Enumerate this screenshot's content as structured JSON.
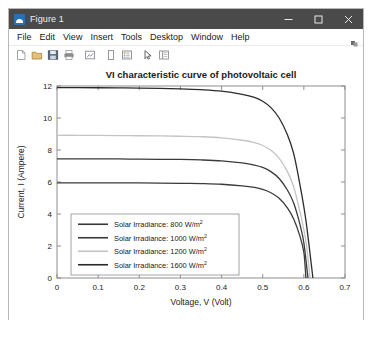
{
  "window": {
    "title": "Figure 1",
    "icon": "matlab-figure-icon",
    "controls": [
      {
        "name": "minimize",
        "glyph": "minimize-icon"
      },
      {
        "name": "maximize",
        "glyph": "maximize-icon"
      },
      {
        "name": "close",
        "glyph": "close-icon"
      }
    ]
  },
  "menubar": {
    "items": [
      "File",
      "Edit",
      "View",
      "Insert",
      "Tools",
      "Desktop",
      "Window",
      "Help"
    ],
    "overflow_icon": "overflow-chevron-icon"
  },
  "toolbar": {
    "buttons": [
      "new-figure-icon",
      "open-file-icon",
      "save-figure-icon",
      "print-figure-icon",
      "link-plot-icon",
      "insert-colorbar-icon",
      "insert-legend-icon",
      "edit-plot-icon",
      "hide-plot-tools-icon"
    ]
  },
  "chart_data": {
    "type": "line",
    "title": "VI characteristic curve of photovoltaic cell",
    "xlabel": "Voltage, V (Volt)",
    "ylabel": "Current, I (Ampere)",
    "xlim": [
      0,
      0.7
    ],
    "ylim": [
      0,
      12
    ],
    "xticks": [
      0,
      0.1,
      0.2,
      0.3,
      0.4,
      0.5,
      0.6,
      0.7
    ],
    "xtick_labels": [
      "0",
      "0.1",
      "0.2",
      "0.3",
      "0.4",
      "0.5",
      "0.6",
      "0.7"
    ],
    "yticks": [
      0,
      2,
      4,
      6,
      8,
      10,
      12
    ],
    "ytick_labels": [
      "0",
      "2",
      "4",
      "6",
      "8",
      "10",
      "12"
    ],
    "grid": false,
    "legend_position": "lower-left",
    "series": [
      {
        "name": "Solar Irradiance: 800 W/m",
        "superscript": "2",
        "irradiance": 800,
        "color": "#3a3a3a",
        "isc": 5.95,
        "voc": 0.605,
        "x": [
          0,
          0.05,
          0.1,
          0.15,
          0.2,
          0.25,
          0.3,
          0.35,
          0.4,
          0.45,
          0.48,
          0.5,
          0.52,
          0.54,
          0.56,
          0.575,
          0.59,
          0.6,
          0.605
        ],
        "y": [
          5.95,
          5.95,
          5.95,
          5.94,
          5.94,
          5.93,
          5.92,
          5.9,
          5.86,
          5.76,
          5.66,
          5.54,
          5.33,
          4.98,
          4.38,
          3.7,
          2.65,
          1.6,
          0.0
        ]
      },
      {
        "name": "Solar Irradiance: 1000 W/m",
        "superscript": "2",
        "irradiance": 1000,
        "color": "#3a3a3a",
        "isc": 7.45,
        "voc": 0.61,
        "x": [
          0,
          0.05,
          0.1,
          0.15,
          0.2,
          0.25,
          0.3,
          0.35,
          0.4,
          0.45,
          0.48,
          0.5,
          0.52,
          0.54,
          0.56,
          0.575,
          0.59,
          0.6,
          0.61
        ],
        "y": [
          7.45,
          7.45,
          7.45,
          7.44,
          7.43,
          7.42,
          7.41,
          7.38,
          7.32,
          7.19,
          7.06,
          6.91,
          6.65,
          6.22,
          5.5,
          4.7,
          3.4,
          2.2,
          0.0
        ]
      },
      {
        "name": "Solar Irradiance: 1200 W/m",
        "superscript": "2",
        "irradiance": 1200,
        "color": "#c4c4c4",
        "isc": 8.92,
        "voc": 0.615,
        "x": [
          0,
          0.05,
          0.1,
          0.15,
          0.2,
          0.25,
          0.3,
          0.35,
          0.4,
          0.45,
          0.48,
          0.5,
          0.52,
          0.54,
          0.56,
          0.575,
          0.59,
          0.605,
          0.615
        ],
        "y": [
          8.92,
          8.92,
          8.91,
          8.9,
          8.89,
          8.88,
          8.86,
          8.83,
          8.76,
          8.61,
          8.46,
          8.28,
          7.98,
          7.48,
          6.65,
          5.72,
          4.2,
          2.3,
          0.0
        ]
      },
      {
        "name": "Solar Irradiance: 1600 W/m",
        "superscript": "2",
        "irradiance": 1600,
        "color": "#2b2b2b",
        "isc": 11.9,
        "voc": 0.622,
        "x": [
          0,
          0.05,
          0.1,
          0.15,
          0.2,
          0.25,
          0.3,
          0.35,
          0.4,
          0.45,
          0.48,
          0.5,
          0.52,
          0.54,
          0.56,
          0.575,
          0.59,
          0.605,
          0.622
        ],
        "y": [
          11.9,
          11.9,
          11.89,
          11.88,
          11.87,
          11.85,
          11.82,
          11.77,
          11.68,
          11.48,
          11.29,
          11.05,
          10.65,
          10.0,
          8.95,
          7.8,
          5.9,
          3.6,
          0.0
        ]
      }
    ]
  }
}
